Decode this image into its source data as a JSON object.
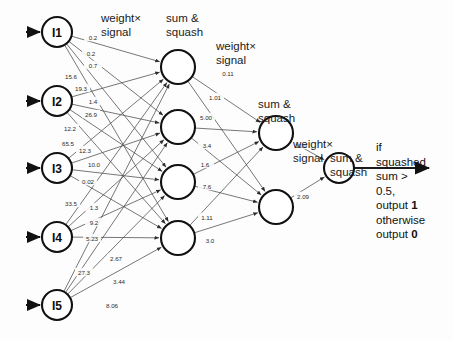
{
  "diagram": {
    "canvas": {
      "width": 453,
      "height": 341
    },
    "colors": {
      "node_stroke": "#111111",
      "node_fill": "#ffffff",
      "edge": "#4a4a4a",
      "output_edge": "#1a1a1a",
      "text": "#121212"
    },
    "headings": [
      {
        "name": "weight-signal-1",
        "text": "weight×\nsignal",
        "x": 101,
        "y": 12
      },
      {
        "name": "sum-squash-1",
        "text": "sum &\nsquash",
        "x": 166,
        "y": 12
      },
      {
        "name": "weight-signal-2",
        "text": "weight×\nsignal",
        "x": 216,
        "y": 40
      },
      {
        "name": "sum-squash-2",
        "text": "sum &\nsquash",
        "x": 258,
        "y": 98
      },
      {
        "name": "weight-signal-3",
        "text": "weight×\nsignal",
        "x": 293,
        "y": 138
      },
      {
        "name": "sum-squash-3",
        "text": "sum &\nsquash",
        "x": 330,
        "y": 152
      }
    ],
    "output_text": {
      "name": "output-rule-text",
      "lines": [
        "if",
        "squashed",
        "sum >",
        "0.5,",
        "output 1",
        "otherwise",
        "output 0"
      ],
      "bold_tokens": [
        "1",
        "0"
      ],
      "x": 376,
      "y": 140
    },
    "layers": [
      {
        "name": "input-layer",
        "nodes": [
          {
            "id": "I1",
            "label": "I1",
            "x": 57,
            "y": 32,
            "r": 15
          },
          {
            "id": "I2",
            "label": "I2",
            "x": 57,
            "y": 101,
            "r": 15
          },
          {
            "id": "I3",
            "label": "I3",
            "x": 57,
            "y": 168,
            "r": 15
          },
          {
            "id": "I4",
            "label": "I4",
            "x": 57,
            "y": 237,
            "r": 15
          },
          {
            "id": "I5",
            "label": "I5",
            "x": 57,
            "y": 305,
            "r": 15
          }
        ]
      },
      {
        "name": "hidden-layer-1",
        "nodes": [
          {
            "id": "H1",
            "label": "",
            "x": 178,
            "y": 67,
            "r": 17
          },
          {
            "id": "H2",
            "label": "",
            "x": 178,
            "y": 127,
            "r": 17
          },
          {
            "id": "H3",
            "label": "",
            "x": 178,
            "y": 182,
            "r": 17
          },
          {
            "id": "H4",
            "label": "",
            "x": 178,
            "y": 238,
            "r": 17
          }
        ]
      },
      {
        "name": "hidden-layer-2",
        "nodes": [
          {
            "id": "G1",
            "label": "",
            "x": 276,
            "y": 133,
            "r": 17
          },
          {
            "id": "G2",
            "label": "",
            "x": 276,
            "y": 207,
            "r": 17
          }
        ]
      },
      {
        "name": "output-layer",
        "nodes": [
          {
            "id": "O1",
            "label": "",
            "x": 339,
            "y": 168,
            "r": 15
          }
        ]
      }
    ],
    "input_arrows": [
      {
        "name": "input-arrow-i1",
        "x1": 26,
        "y1": 32,
        "x2": 40,
        "y2": 32
      },
      {
        "name": "input-arrow-i2",
        "x1": 26,
        "y1": 101,
        "x2": 40,
        "y2": 101
      },
      {
        "name": "input-arrow-i3",
        "x1": 26,
        "y1": 168,
        "x2": 40,
        "y2": 168
      },
      {
        "name": "input-arrow-i4",
        "x1": 26,
        "y1": 237,
        "x2": 40,
        "y2": 237
      },
      {
        "name": "input-arrow-i5",
        "x1": 26,
        "y1": 305,
        "x2": 40,
        "y2": 305
      }
    ],
    "output_arrow": {
      "name": "output-arrow",
      "x1": 354,
      "y1": 168,
      "x2": 429,
      "y2": 168
    },
    "weight_labels": [
      {
        "value": "0.2",
        "x": 93,
        "y": 37
      },
      {
        "value": "0.2",
        "x": 91,
        "y": 53
      },
      {
        "value": "0.7",
        "x": 93,
        "y": 65
      },
      {
        "value": "15.6",
        "x": 71,
        "y": 76
      },
      {
        "value": "19.3",
        "x": 81,
        "y": 88
      },
      {
        "value": "1.4",
        "x": 93,
        "y": 101
      },
      {
        "value": "26.9",
        "x": 91,
        "y": 114
      },
      {
        "value": "12.2",
        "x": 70,
        "y": 128
      },
      {
        "value": "65.5",
        "x": 68,
        "y": 143
      },
      {
        "value": "12.3",
        "x": 85,
        "y": 150
      },
      {
        "value": "10.0",
        "x": 94,
        "y": 164
      },
      {
        "value": "0.02",
        "x": 88,
        "y": 181
      },
      {
        "value": "33.5",
        "x": 71,
        "y": 203
      },
      {
        "value": "1.3",
        "x": 94,
        "y": 207
      },
      {
        "value": "9.2",
        "x": 94,
        "y": 222
      },
      {
        "value": "5.23",
        "x": 92,
        "y": 238
      },
      {
        "value": "27.3",
        "x": 84,
        "y": 272
      },
      {
        "value": "2.67",
        "x": 116,
        "y": 258
      },
      {
        "value": "3.44",
        "x": 119,
        "y": 281
      },
      {
        "value": "8.06",
        "x": 112,
        "y": 305
      },
      {
        "value": "0.11",
        "x": 228,
        "y": 73
      },
      {
        "value": "1.01",
        "x": 215,
        "y": 97
      },
      {
        "value": "5.00",
        "x": 206,
        "y": 117
      },
      {
        "value": "3.4",
        "x": 207,
        "y": 145
      },
      {
        "value": "1.6",
        "x": 205,
        "y": 164
      },
      {
        "value": "7.6",
        "x": 207,
        "y": 186
      },
      {
        "value": "1.11",
        "x": 207,
        "y": 217
      },
      {
        "value": "3.0",
        "x": 210,
        "y": 240
      },
      {
        "value": "11.0",
        "x": 301,
        "y": 145
      },
      {
        "value": "2.09",
        "x": 303,
        "y": 196
      }
    ]
  }
}
